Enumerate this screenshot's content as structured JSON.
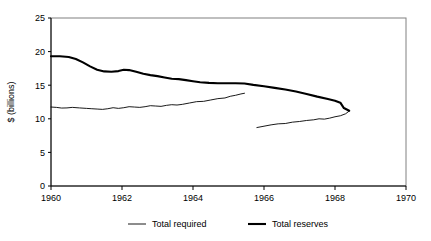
{
  "chart_data": {
    "type": "line",
    "title": "",
    "xlabel": "",
    "ylabel": "$ (billions)",
    "xlim": [
      1960,
      1970
    ],
    "ylim": [
      0,
      25
    ],
    "xticks": [
      1960,
      1962,
      1964,
      1966,
      1968,
      1970
    ],
    "xtick_labels": [
      "1960",
      "1962",
      "1964",
      "1966",
      "1968",
      "1970"
    ],
    "yticks": [
      0,
      5,
      10,
      15,
      20,
      25
    ],
    "ytick_labels": [
      "0",
      "5",
      "10",
      "15",
      "20",
      "25"
    ],
    "grid": false,
    "legend_position": "bottom",
    "frame": "box",
    "series": [
      {
        "name": "Total required",
        "style": "thin",
        "color": "#000000",
        "linewidth": 0.9,
        "has_break": true,
        "break_note": "series splits mid-1965; second segment starts lower",
        "segments": [
          {
            "x": [
              1960.0,
              1960.15,
              1960.3,
              1960.45,
              1960.6,
              1960.8,
              1961.0,
              1961.15,
              1961.3,
              1961.45,
              1961.6,
              1961.75,
              1961.9,
              1962.05,
              1962.2,
              1962.35,
              1962.5,
              1962.65,
              1962.8,
              1962.95,
              1963.1,
              1963.25,
              1963.4,
              1963.55,
              1963.7,
              1963.9,
              1964.1,
              1964.3,
              1964.5,
              1964.7,
              1964.9,
              1965.05,
              1965.2,
              1965.35,
              1965.45
            ],
            "y": [
              11.75,
              11.7,
              11.6,
              11.62,
              11.7,
              11.62,
              11.55,
              11.5,
              11.45,
              11.4,
              11.5,
              11.65,
              11.55,
              11.65,
              11.8,
              11.75,
              11.7,
              11.8,
              11.95,
              11.9,
              11.85,
              12.0,
              12.1,
              12.05,
              12.15,
              12.35,
              12.55,
              12.6,
              12.8,
              13.0,
              13.1,
              13.35,
              13.5,
              13.7,
              13.8
            ]
          },
          {
            "x": [
              1965.8,
              1966.0,
              1966.2,
              1966.4,
              1966.6,
              1966.8,
              1967.0,
              1967.2,
              1967.4,
              1967.55,
              1967.7,
              1967.85,
              1968.0,
              1968.15,
              1968.3,
              1968.4
            ],
            "y": [
              8.7,
              8.9,
              9.1,
              9.25,
              9.3,
              9.5,
              9.6,
              9.75,
              9.85,
              10.0,
              9.95,
              10.1,
              10.3,
              10.45,
              10.75,
              11.15
            ]
          }
        ]
      },
      {
        "name": "Total reserves",
        "style": "thick",
        "color": "#000000",
        "linewidth": 2.1,
        "has_break": false,
        "segments": [
          {
            "x": [
              1960.0,
              1960.25,
              1960.5,
              1960.7,
              1960.9,
              1961.1,
              1961.3,
              1961.5,
              1961.7,
              1961.9,
              1962.05,
              1962.2,
              1962.4,
              1962.6,
              1962.8,
              1963.0,
              1963.2,
              1963.4,
              1963.6,
              1963.8,
              1964.0,
              1964.2,
              1964.45,
              1964.7,
              1964.95,
              1965.2,
              1965.45,
              1965.7,
              1966.0,
              1966.3,
              1966.6,
              1966.9,
              1967.2,
              1967.5,
              1967.8,
              1968.0,
              1968.15,
              1968.25,
              1968.4
            ],
            "y": [
              19.3,
              19.3,
              19.2,
              18.9,
              18.4,
              17.8,
              17.3,
              17.05,
              17.0,
              17.1,
              17.3,
              17.25,
              17.0,
              16.7,
              16.5,
              16.35,
              16.15,
              15.95,
              15.9,
              15.75,
              15.6,
              15.45,
              15.35,
              15.3,
              15.3,
              15.3,
              15.25,
              15.05,
              14.85,
              14.6,
              14.35,
              14.05,
              13.7,
              13.3,
              12.95,
              12.7,
              12.4,
              11.6,
              11.2
            ]
          }
        ]
      }
    ],
    "legend": [
      {
        "label": "Total required",
        "style": "thin"
      },
      {
        "label": "Total reserves",
        "style": "thick"
      }
    ]
  }
}
